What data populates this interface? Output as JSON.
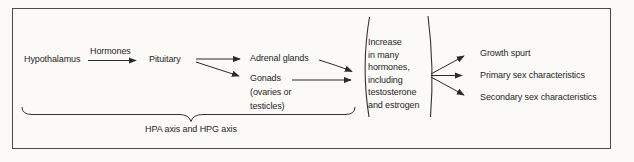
{
  "flowchart": {
    "hypothalamus": "Hypothalamus",
    "hormones_label": "Hormones",
    "pituitary": "Pituitary",
    "adrenal_glands": "Adrenal glands",
    "gonads": [
      "Gonads",
      "(ovaries or",
      "testicles)"
    ],
    "increase_block": [
      "Increase",
      "in many",
      "hormones,",
      "including",
      "testosterone",
      "and estrogen"
    ],
    "outcomes": [
      "Growth spurt",
      "Primary sex characteristics",
      "Secondary sex characteristics"
    ],
    "axis_label": "HPA axis and HPG axis"
  },
  "colors": {
    "ink": "#2b2b2b",
    "line": "#333333",
    "frame": "#4a4a4a",
    "background": "#fbfaf7"
  }
}
